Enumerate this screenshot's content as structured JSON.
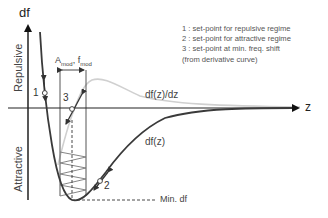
{
  "axes": {
    "y_label": "df",
    "x_label": "z",
    "upper_region": "Repulsive",
    "lower_region": "Attractive"
  },
  "curves": {
    "main": "df(z)",
    "derivative": "df(z)/dz"
  },
  "annotations": {
    "modulation_A": "A",
    "modulation_A_sub": "mod",
    "modulation_sep": ", ",
    "modulation_f": "f",
    "modulation_f_sub": "mod",
    "min_label": "Min. df",
    "point1": "1",
    "point2": "2",
    "point3": "3"
  },
  "legend": {
    "items": [
      "1 : set-point for repulsive regime",
      "2 : set-point for attractive regime",
      "3 : set-point at min. freq. shift",
      "(from derivative curve)"
    ]
  },
  "colors": {
    "curve": "#3a3a3a",
    "derivative": "#cfcfcf",
    "axis": "#222222"
  }
}
